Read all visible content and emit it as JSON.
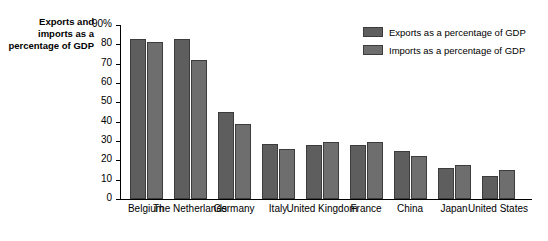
{
  "chart_data": {
    "type": "bar",
    "title": "",
    "ylabel": "Exports and imports as a percentage of GDP",
    "xlabel": "",
    "ylim": [
      0,
      90
    ],
    "ytick_labels": [
      "90%",
      "80",
      "70",
      "60",
      "50",
      "40",
      "30",
      "20",
      "10",
      "0"
    ],
    "ytick_values": [
      90,
      80,
      70,
      60,
      50,
      40,
      30,
      20,
      10,
      0
    ],
    "grid": false,
    "legend_position": "top-right",
    "categories": [
      "Belgium",
      "The Netherlands",
      "Germany",
      "Italy",
      "United Kingdom",
      "France",
      "China",
      "Japan",
      "United States"
    ],
    "series": [
      {
        "name": "Exports as a percentage of GDP",
        "color": "#5e5e5e",
        "values": [
          83,
          83,
          45,
          28.5,
          28,
          28,
          25,
          16,
          12
        ]
      },
      {
        "name": "Imports as a percentage of GDP",
        "color": "#6e6e6e",
        "values": [
          81,
          72,
          39,
          26,
          29.5,
          29.5,
          22.5,
          17.5,
          15
        ]
      }
    ]
  },
  "legend": {
    "items": [
      {
        "label": "Exports as a percentage of GDP"
      },
      {
        "label": "Imports as a percentage of GDP"
      }
    ]
  },
  "axis": {
    "y_title": "Exports and imports as a percentage of GDP"
  }
}
